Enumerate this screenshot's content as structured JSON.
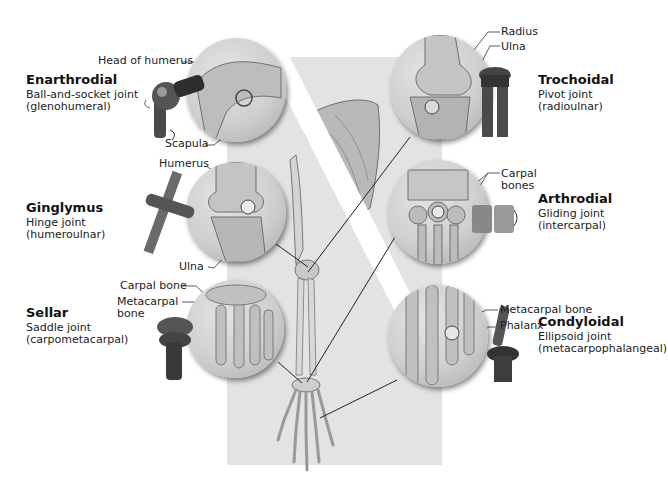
{
  "figure": {
    "background_color": "#ffffff",
    "panel_color": "#e3e3e3"
  },
  "joints": [
    {
      "id": "enarthrodial",
      "name": "Enarthrodial",
      "type": "Ball-and-socket joint",
      "example": "(glenohumeral)",
      "side": "left",
      "labels": [
        "Head of humerus",
        "Scapula"
      ],
      "model_icon": "ball-and-socket-model-icon"
    },
    {
      "id": "ginglymus",
      "name": "Ginglymus",
      "type": "Hinge joint",
      "example": "(humeroulnar)",
      "side": "left",
      "labels": [
        "Humerus",
        "Ulna"
      ],
      "model_icon": "hinge-model-icon"
    },
    {
      "id": "sellar",
      "name": "Sellar",
      "type": "Saddle joint",
      "example": "(carpometacarpal)",
      "side": "left",
      "labels": [
        "Carpal bone",
        "Metacarpal",
        "bone"
      ],
      "model_icon": "saddle-model-icon"
    },
    {
      "id": "trochoidal",
      "name": "Trochoidal",
      "type": "Pivot joint",
      "example": "(radioulnar)",
      "side": "right",
      "labels": [
        "Radius",
        "Ulna"
      ],
      "model_icon": "pivot-model-icon"
    },
    {
      "id": "arthrodial",
      "name": "Arthrodial",
      "type": "Gliding joint",
      "example": "(intercarpal)",
      "side": "right",
      "labels": [
        "Carpal",
        "bones"
      ],
      "model_icon": "gliding-model-icon"
    },
    {
      "id": "condyloidal",
      "name": "Condyloidal",
      "type": "Ellipsoid joint",
      "example": "(metacarpophalangeal)",
      "side": "right",
      "labels": [
        "Metacarpal bone",
        "Phalanx"
      ],
      "model_icon": "ellipsoid-model-icon"
    }
  ]
}
